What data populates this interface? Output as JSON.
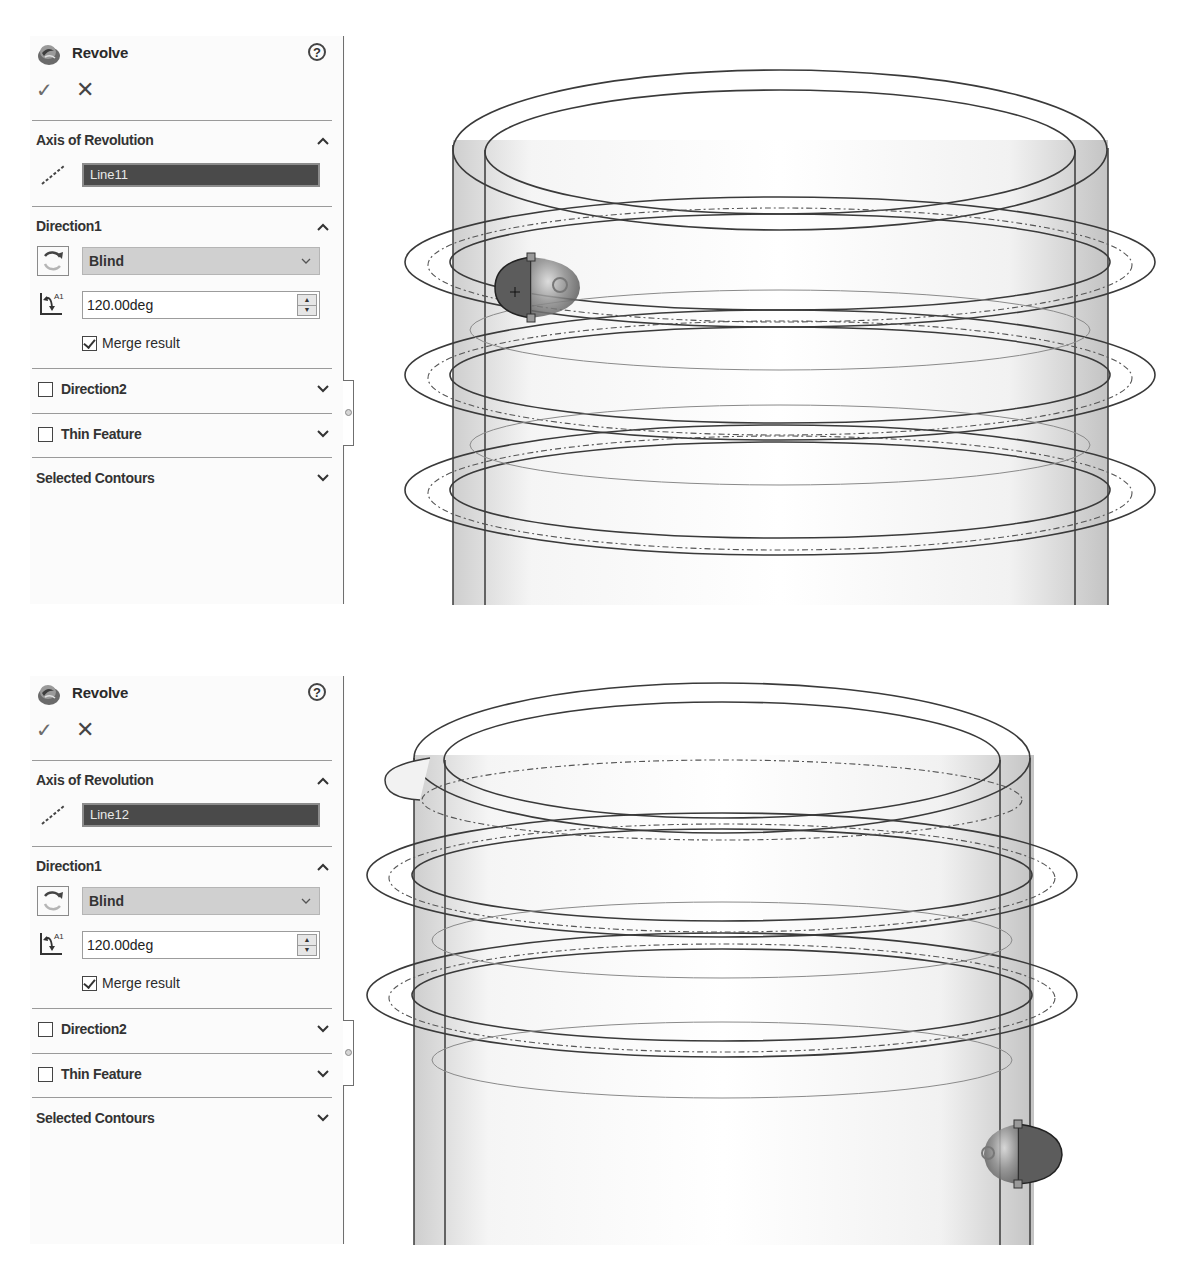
{
  "screens": [
    {
      "panel": {
        "title": "Revolve",
        "help_icon": "?",
        "ok_icon": "✓",
        "cancel_icon": "✕",
        "axis_section": {
          "title": "Axis of Revolution",
          "selected_entity": "Line11"
        },
        "direction1": {
          "title": "Direction1",
          "end_condition": "Blind",
          "angle": "120.00deg",
          "merge_result_label": "Merge result",
          "merge_result_checked": true
        },
        "direction2": {
          "title": "Direction2",
          "checked": false
        },
        "thin_feature": {
          "title": "Thin Feature",
          "checked": false
        },
        "selected_contours": {
          "title": "Selected Contours"
        }
      },
      "viewport": {
        "preview_position": "left",
        "axis_line": "Line11"
      }
    },
    {
      "panel": {
        "title": "Revolve",
        "help_icon": "?",
        "ok_icon": "✓",
        "cancel_icon": "✕",
        "axis_section": {
          "title": "Axis of Revolution",
          "selected_entity": "Line12"
        },
        "direction1": {
          "title": "Direction1",
          "end_condition": "Blind",
          "angle": "120.00deg",
          "merge_result_label": "Merge result",
          "merge_result_checked": true
        },
        "direction2": {
          "title": "Direction2",
          "checked": false
        },
        "thin_feature": {
          "title": "Thin Feature",
          "checked": false
        },
        "selected_contours": {
          "title": "Selected Contours"
        }
      },
      "viewport": {
        "preview_position": "right",
        "axis_line": "Line12"
      }
    }
  ],
  "colors": {
    "panel_bg": "#fbfbfb",
    "selection_field_bg": "#4a4a4a",
    "dropdown_bg": "#d0d0d0",
    "model_edge": "#3a3a3a",
    "preview_body": "#6e6e6e"
  }
}
